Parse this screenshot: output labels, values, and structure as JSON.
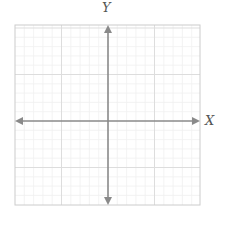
{
  "diagram": {
    "type": "cartesian-coordinate-plane",
    "x_axis_label": "X",
    "y_axis_label": "Y",
    "grid": {
      "left": 15,
      "top": 25,
      "right": 200,
      "bottom": 205,
      "origin_x": 108,
      "origin_y": 121,
      "major_spacing": 46.5,
      "minor_per_major": 5
    },
    "colors": {
      "axis": "#8a8a8a",
      "border": "#cccccc",
      "major_grid": "#dddddd",
      "minor_grid": "#f0f0f0",
      "label": "#555555"
    }
  }
}
